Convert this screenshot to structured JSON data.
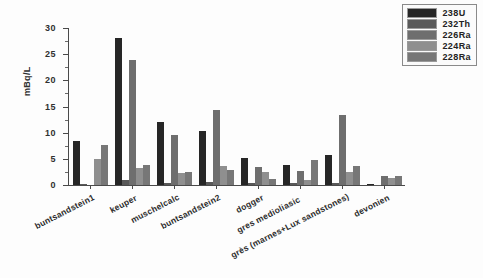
{
  "chart_data": {
    "type": "bar",
    "title": "",
    "xlabel": "",
    "ylabel": "mBq/L",
    "ylim": [
      0,
      30
    ],
    "yticks": [
      0,
      5,
      10,
      15,
      20,
      25,
      30
    ],
    "ytick_labels": [
      "0",
      "5",
      "10",
      "15",
      "20",
      "25",
      "30"
    ],
    "grid": false,
    "legend_position": "top-right",
    "categories": [
      "buntsandstein1",
      "keuper",
      "muschelcalc",
      "buntsandstein2",
      "dogger",
      "gres medioliasic",
      "grès (marnes+Lux sandstones)",
      "devonien"
    ],
    "series": [
      {
        "name": "238U",
        "color": "#262626",
        "values": [
          8.4,
          28.1,
          12.0,
          10.4,
          5.2,
          3.9,
          5.7,
          0.2
        ]
      },
      {
        "name": "232Th",
        "color": "#595959",
        "values": [
          0.15,
          0.9,
          0.4,
          0.5,
          0.4,
          0.3,
          0.4,
          0.05
        ]
      },
      {
        "name": "226Ra",
        "color": "#6e6e6e",
        "values": [
          0.0,
          23.8,
          9.5,
          14.4,
          3.5,
          2.6,
          13.4,
          1.8
        ]
      },
      {
        "name": "224Ra",
        "color": "#8f8f8f",
        "values": [
          4.9,
          3.3,
          2.3,
          3.6,
          2.5,
          0.9,
          2.5,
          1.3
        ]
      },
      {
        "name": "228Ra",
        "color": "#777777",
        "values": [
          7.7,
          3.8,
          2.4,
          2.8,
          1.2,
          4.8,
          3.7,
          1.7
        ]
      }
    ]
  },
  "legend": {
    "items": [
      {
        "label": "238U"
      },
      {
        "label": "232Th"
      },
      {
        "label": "226Ra"
      },
      {
        "label": "224Ra"
      },
      {
        "label": "228Ra"
      }
    ]
  }
}
